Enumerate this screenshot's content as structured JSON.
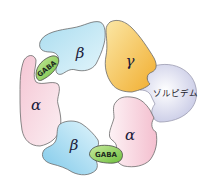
{
  "diagram": {
    "subunits": [
      {
        "id": "beta_top",
        "label": "β",
        "color": "#bfe6f2"
      },
      {
        "id": "gamma",
        "label": "γ",
        "color": "#f3c250"
      },
      {
        "id": "alpha_left",
        "label": "α",
        "color": "#f6d6e0"
      },
      {
        "id": "alpha_right",
        "label": "α",
        "color": "#f6d6e0"
      },
      {
        "id": "beta_bottom",
        "label": "β",
        "color": "#bfe6f2"
      }
    ],
    "binding_sites": [
      {
        "id": "gaba_left",
        "label": "GABA",
        "color": "#9fd46a"
      },
      {
        "id": "gaba_bottom",
        "label": "GABA",
        "color": "#9fd46a"
      },
      {
        "id": "zolpidem",
        "label": "ゾルピデム",
        "color": "#e2e3f2"
      }
    ]
  }
}
